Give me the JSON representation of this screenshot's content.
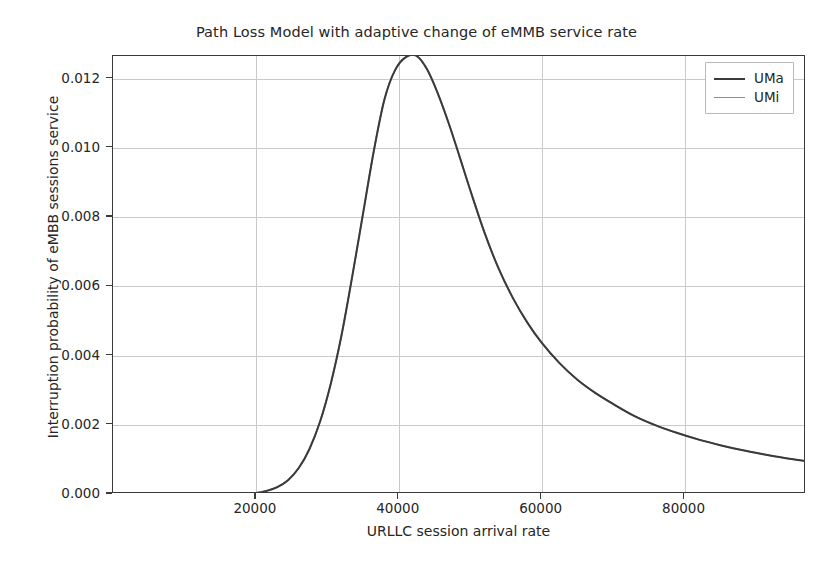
{
  "chart_data": {
    "type": "line",
    "title": "Path Loss Model with adaptive change of eMMB service rate",
    "xlabel": "URLLC session arrival rate",
    "ylabel": "Interruption probability of eMBB sessions service",
    "xlim": [
      0,
      97000
    ],
    "ylim": [
      0,
      0.01265
    ],
    "xticks": [
      20000,
      40000,
      60000,
      80000
    ],
    "xtick_labels": [
      "20000",
      "40000",
      "60000",
      "80000"
    ],
    "yticks": [
      0.0,
      0.002,
      0.004,
      0.006,
      0.008,
      0.01,
      0.012
    ],
    "ytick_labels": [
      "0.000",
      "0.002",
      "0.004",
      "0.006",
      "0.008",
      "0.010",
      "0.012"
    ],
    "grid": true,
    "legend_position": "upper right",
    "legend": [
      "UMa",
      "UMi"
    ],
    "series": [
      {
        "name": "UMa",
        "color": "#3a3a3a",
        "linewidth": 2.0,
        "x": [
          0,
          2500,
          5000,
          7500,
          10000,
          12500,
          15000,
          17500,
          20000,
          21500,
          23000,
          24500,
          26000,
          27500,
          29000,
          30500,
          32000,
          33500,
          35000,
          36500,
          38000,
          39500,
          41000,
          42500,
          44000,
          45500,
          47000,
          48500,
          50000,
          52000,
          54000,
          56000,
          58000,
          60000,
          62500,
          65000,
          67500,
          70000,
          73000,
          76000,
          79000,
          82000,
          85000,
          88000,
          91000,
          94000,
          97000
        ],
        "y": [
          0.0,
          0.0,
          0.0,
          0.0,
          0.0,
          0.0,
          2e-06,
          8e-06,
          3e-05,
          9e-05,
          0.0002,
          0.0004,
          0.00075,
          0.0013,
          0.0021,
          0.0032,
          0.0046,
          0.0063,
          0.0081,
          0.0099,
          0.0114,
          0.01225,
          0.01262,
          0.01265,
          0.01225,
          0.01155,
          0.0107,
          0.00975,
          0.00878,
          0.00755,
          0.0065,
          0.00565,
          0.00495,
          0.00437,
          0.00378,
          0.0033,
          0.00292,
          0.0026,
          0.00225,
          0.00198,
          0.00176,
          0.00157,
          0.00141,
          0.00127,
          0.00115,
          0.00104,
          0.00095
        ]
      },
      {
        "name": "UMi",
        "color": "#8f8f8f",
        "linewidth": 1.6,
        "x": [
          0,
          2500,
          5000,
          7500,
          10000,
          12500,
          15000,
          17500,
          20000,
          21500,
          23000,
          24500,
          26000,
          27500,
          29000,
          30500,
          32000,
          33500,
          35000,
          36500,
          38000,
          39500,
          41000,
          42500,
          44000,
          45500,
          47000,
          48500,
          50000,
          52000,
          54000,
          56000,
          58000,
          60000,
          62500,
          65000,
          67500,
          70000,
          73000,
          76000,
          79000,
          82000,
          85000,
          88000,
          91000,
          94000,
          97000
        ],
        "y": [
          0.0,
          0.0,
          0.0,
          0.0,
          0.0,
          0.0,
          2e-06,
          8e-06,
          3e-05,
          9e-05,
          0.0002,
          0.0004,
          0.00075,
          0.0013,
          0.0021,
          0.0032,
          0.0046,
          0.0063,
          0.0081,
          0.0099,
          0.0114,
          0.01225,
          0.01262,
          0.01265,
          0.01225,
          0.01155,
          0.0107,
          0.00975,
          0.00878,
          0.00755,
          0.0065,
          0.00565,
          0.00495,
          0.00437,
          0.00378,
          0.0033,
          0.00292,
          0.0026,
          0.00225,
          0.00198,
          0.00176,
          0.00157,
          0.00141,
          0.00127,
          0.00115,
          0.00104,
          0.00095
        ]
      }
    ]
  }
}
